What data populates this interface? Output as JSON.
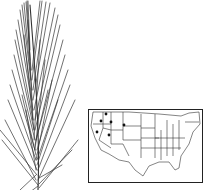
{
  "illustration": {
    "subject": "grass inflorescence spike with long awns",
    "line_color": "#333333"
  },
  "distribution_map": {
    "region": "contiguous United States",
    "marked_states": [
      "Washington",
      "Oregon",
      "Idaho",
      "Montana",
      "Nevada",
      "California"
    ],
    "dot_color": "#111111",
    "border_color": "#222222"
  },
  "caption": ""
}
